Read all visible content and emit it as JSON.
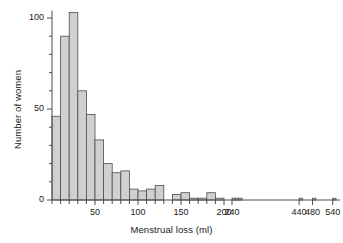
{
  "chart_data": {
    "type": "bar",
    "title": "",
    "subtitle": "",
    "xlabel": "Menstrual loss (ml)",
    "ylabel": "Number of women",
    "grid": false,
    "legend": null,
    "xlim": [
      0,
      570
    ],
    "ylim": [
      0,
      108
    ],
    "ytick_labels": [
      "0",
      "50",
      "100"
    ],
    "ytick_values": [
      0,
      50,
      100
    ],
    "yminor_step": 10,
    "xtick_labels": [
      "50",
      "100",
      "150",
      "200",
      "240",
      "440",
      "480",
      "540"
    ],
    "xtick_values": [
      50,
      100,
      150,
      200,
      240,
      440,
      480,
      540
    ],
    "xminor_step": 10,
    "axis_break_after": 200,
    "bin_width": 10,
    "bar_fill": "#d0d0d0",
    "bar_edge": "#4d4d4d",
    "axis_color": "#4d4d4d",
    "categories": [
      "0-10",
      "10-20",
      "20-30",
      "30-40",
      "40-50",
      "50-60",
      "60-70",
      "70-80",
      "80-90",
      "90-100",
      "100-110",
      "110-120",
      "120-130",
      "130-140",
      "140-150",
      "150-160",
      "160-170",
      "170-180",
      "180-190",
      "190-200",
      "240-250",
      "250-260",
      "260-270",
      "440-450",
      "480-490",
      "540-550"
    ],
    "bin_starts": [
      0,
      10,
      20,
      30,
      40,
      50,
      60,
      70,
      80,
      90,
      100,
      110,
      120,
      130,
      140,
      150,
      160,
      170,
      180,
      190,
      240,
      250,
      260,
      440,
      480,
      540
    ],
    "values": [
      46,
      90,
      103,
      60,
      47,
      33,
      20,
      15,
      16,
      6,
      5,
      6,
      8,
      0,
      3,
      4,
      1,
      1,
      4,
      1,
      1,
      1,
      1,
      1,
      1,
      1
    ]
  },
  "annotations": {
    "note": ""
  }
}
